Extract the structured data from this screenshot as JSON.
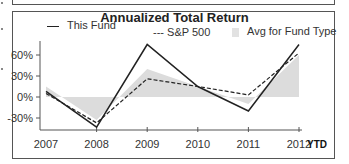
{
  "chart_data": {
    "type": "line",
    "title": "Annualized Total Return",
    "xlabel": "",
    "ylabel": "",
    "categories": [
      "2007",
      "2008",
      "2009",
      "2010",
      "2011",
      "2012"
    ],
    "x_suffix_label": "YTD",
    "y_ticks": [
      "60%",
      "30%",
      "0%",
      "-30%"
    ],
    "ylim": [
      -45,
      80
    ],
    "grid": false,
    "legend_position": "top",
    "series": [
      {
        "name": "This Fund",
        "style": "solid",
        "color": "#222222",
        "values": [
          8,
          -43,
          75,
          15,
          -20,
          75
        ]
      },
      {
        "name": "S&P 500",
        "style": "dashed",
        "color": "#222222",
        "values": [
          5,
          -37,
          26,
          15,
          3,
          63
        ]
      },
      {
        "name": "Avg for Fund Type",
        "style": "area",
        "color": "#dcdcdc",
        "values": [
          15,
          -33,
          40,
          15,
          -10,
          60
        ]
      }
    ]
  },
  "legend": {
    "fund": "This Fund",
    "sp500_prefix": "---",
    "sp500": "S&P 500",
    "avg": "Avg for Fund Type"
  }
}
